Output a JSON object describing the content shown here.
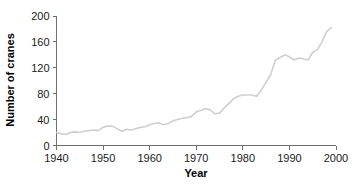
{
  "chart_data": {
    "type": "line",
    "title": "",
    "xlabel": "Year",
    "ylabel": "Number of cranes",
    "xlim": [
      1940,
      2000
    ],
    "ylim": [
      0,
      200
    ],
    "grid": false,
    "legend": null,
    "line_color": "#cfcfcf",
    "axis_color": "#6f6f6f",
    "x_ticks": [
      1940,
      1950,
      1960,
      1970,
      1980,
      1990,
      2000
    ],
    "x_tick_labels": [
      "1940",
      "1950",
      "1960",
      "1970",
      "1980",
      "1990",
      "2000"
    ],
    "y_ticks": [
      0,
      40,
      80,
      120,
      160,
      200
    ],
    "y_tick_labels": [
      "0",
      "40",
      "80",
      "120",
      "160",
      "200"
    ],
    "series": [
      {
        "name": "Number of cranes",
        "x": [
          1940,
          1941,
          1942,
          1943,
          1944,
          1945,
          1946,
          1947,
          1948,
          1949,
          1950,
          1951,
          1952,
          1953,
          1954,
          1955,
          1956,
          1957,
          1958,
          1959,
          1960,
          1961,
          1962,
          1963,
          1964,
          1965,
          1966,
          1967,
          1968,
          1969,
          1970,
          1971,
          1972,
          1973,
          1974,
          1975,
          1976,
          1977,
          1978,
          1979,
          1980,
          1981,
          1982,
          1983,
          1984,
          1985,
          1986,
          1987,
          1988,
          1989,
          1990,
          1991,
          1992,
          1993,
          1994,
          1995,
          1996,
          1997,
          1998,
          1999
        ],
        "values": [
          20,
          18,
          17,
          20,
          21,
          20,
          22,
          23,
          24,
          23,
          28,
          30,
          30,
          26,
          22,
          25,
          24,
          26,
          28,
          29,
          32,
          34,
          35,
          32,
          34,
          38,
          40,
          42,
          43,
          45,
          52,
          54,
          57,
          55,
          49,
          50,
          58,
          65,
          72,
          76,
          78,
          78,
          78,
          76,
          86,
          98,
          110,
          132,
          136,
          140,
          137,
          132,
          135,
          134,
          132,
          144,
          148,
          160,
          176,
          182
        ]
      }
    ]
  },
  "axes": {
    "y_title": "Number of cranes",
    "x_title": "Year"
  }
}
